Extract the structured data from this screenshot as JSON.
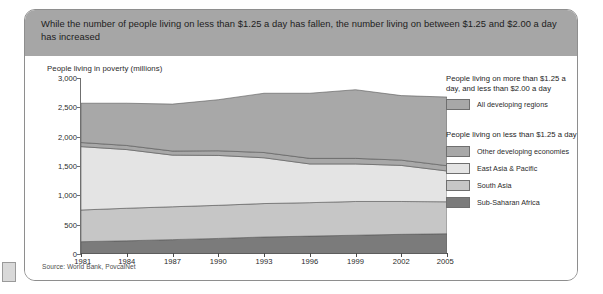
{
  "card": {
    "title": "While the number of people living on less than $1.25 a day has fallen, the number living on between $1.25 and $2.00 a day has increased",
    "source": "Source: World Bank, PovcalNet"
  },
  "legend": {
    "group1_title": "People living on more than $1.25 a day, and less than $2.00 a day",
    "group2_title": "People living on less than $1.25 a day",
    "items": [
      {
        "label": "All developing regions",
        "color": "#a8a8a8"
      },
      {
        "label": "Other developing economies",
        "color": "#a8a8a8"
      },
      {
        "label": "East Asia & Pacific",
        "color": "#e4e4e4"
      },
      {
        "label": "South Asia",
        "color": "#c6c6c6"
      },
      {
        "label": "Sub-Saharan Africa",
        "color": "#7b7b7b"
      }
    ]
  },
  "chart_data": {
    "type": "area",
    "stacked": true,
    "title": "While the number of people living on less than $1.25 a day has fallen, the number living on between $1.25 and $2.00 a day has increased",
    "xlabel": "",
    "ylabel": "People living in poverty (millions)",
    "ylim": [
      0,
      3000
    ],
    "yticks": [
      0,
      500,
      1000,
      1500,
      2000,
      2500,
      3000
    ],
    "ytick_labels": [
      "0",
      "500",
      "1,000",
      "1,500",
      "2,000",
      "2,500",
      "3,000"
    ],
    "xlim": [
      1981,
      2005
    ],
    "xticks": [
      1981,
      1984,
      1987,
      1990,
      1993,
      1996,
      1999,
      2002,
      2005
    ],
    "xtick_labels": [
      "1981",
      "1984",
      "1987",
      "1990",
      "1993",
      "1996",
      "1999",
      "2002",
      "2005"
    ],
    "grid": false,
    "legend_position": "right",
    "x": [
      1981,
      1984,
      1987,
      1990,
      1993,
      1996,
      1999,
      2002,
      2005
    ],
    "series": [
      {
        "name": "Sub-Saharan Africa",
        "color": "#7b7b7b",
        "values": [
          210,
          225,
          245,
          265,
          290,
          305,
          320,
          335,
          345
        ]
      },
      {
        "name": "South Asia",
        "color": "#c6c6c6",
        "values": [
          540,
          555,
          560,
          565,
          570,
          570,
          575,
          560,
          545
        ]
      },
      {
        "name": "East Asia & Pacific",
        "color": "#e4e4e4",
        "values": [
          1080,
          1000,
          880,
          850,
          780,
          660,
          640,
          615,
          525
        ]
      },
      {
        "name": "Other developing economies",
        "color": "#a8a8a8",
        "values": [
          70,
          70,
          70,
          80,
          90,
          95,
          95,
          90,
          90
        ]
      },
      {
        "name": "All developing regions",
        "color": "#a8a8a8",
        "values": [
          670,
          720,
          800,
          870,
          1010,
          1110,
          1170,
          1100,
          1170
        ]
      }
    ],
    "totals": [
      2570,
      2570,
      2555,
      2630,
      2740,
      2740,
      2800,
      2700,
      2675
    ],
    "annotations": []
  }
}
